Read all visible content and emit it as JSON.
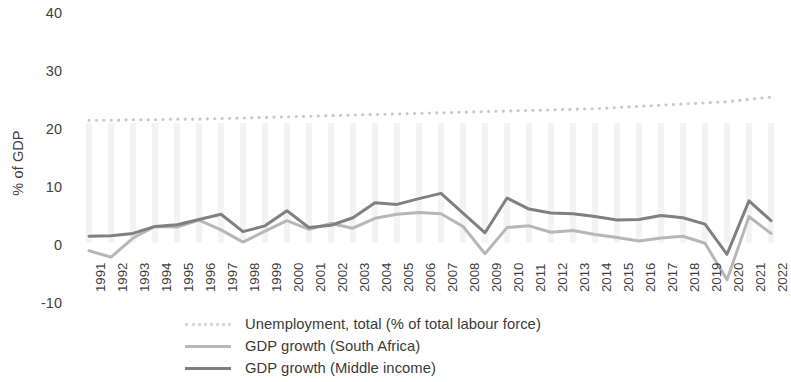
{
  "chart_data": {
    "type": "line",
    "title": "",
    "xlabel": "",
    "ylabel": "% of GDP",
    "ylim": [
      -10,
      40
    ],
    "yticks": [
      40,
      30,
      20,
      10,
      0,
      -10
    ],
    "grid": false,
    "legend_position": "bottom",
    "x": [
      1991,
      1992,
      1993,
      1994,
      1995,
      1996,
      1997,
      1998,
      1999,
      2000,
      2001,
      2002,
      2003,
      2004,
      2005,
      2006,
      2007,
      2008,
      2009,
      2010,
      2011,
      2012,
      2013,
      2014,
      2015,
      2016,
      2017,
      2018,
      2019,
      2020,
      2021,
      2022
    ],
    "categories": [
      "1991",
      "1992",
      "1993",
      "1994",
      "1995",
      "1996",
      "1997",
      "1998",
      "1999",
      "2000",
      "2001",
      "2002",
      "2003",
      "2004",
      "2005",
      "2006",
      "2007",
      "2008",
      "2009",
      "2010",
      "2011",
      "2012",
      "2013",
      "2014",
      "2015",
      "2016",
      "2017",
      "2018",
      "2019",
      "2020",
      "2021",
      "2022"
    ],
    "series": [
      {
        "name": "Unemployment, total (% of total labour force)",
        "style": "dotted",
        "color": "#d9d9d9",
        "values": [
          21.5,
          21.5,
          21.6,
          21.6,
          21.7,
          21.7,
          21.8,
          21.9,
          22.0,
          22.1,
          22.2,
          22.3,
          22.4,
          22.5,
          22.6,
          22.7,
          22.8,
          22.9,
          23.0,
          23.1,
          23.2,
          23.3,
          23.4,
          23.5,
          23.7,
          23.9,
          24.1,
          24.3,
          24.5,
          24.7,
          25.1,
          25.5
        ]
      },
      {
        "name": "GDP growth (South Africa)",
        "style": "solid",
        "color": "#b7b7b7",
        "values": [
          -1.0,
          -2.1,
          1.2,
          3.2,
          3.1,
          4.3,
          2.6,
          0.5,
          2.4,
          4.2,
          2.7,
          3.7,
          2.9,
          4.6,
          5.3,
          5.6,
          5.4,
          3.2,
          -1.5,
          3.0,
          3.3,
          2.2,
          2.5,
          1.8,
          1.3,
          0.7,
          1.2,
          1.5,
          0.3,
          -6.0,
          4.9,
          2.0
        ]
      },
      {
        "name": "GDP growth (Middle income)",
        "style": "solid",
        "color": "#808080",
        "values": [
          1.5,
          1.6,
          2.0,
          3.2,
          3.5,
          4.4,
          5.3,
          2.3,
          3.3,
          5.9,
          3.0,
          3.4,
          4.7,
          7.3,
          7.0,
          8.0,
          8.9,
          5.5,
          2.1,
          8.1,
          6.2,
          5.5,
          5.4,
          4.9,
          4.3,
          4.4,
          5.1,
          4.7,
          3.6,
          -1.6,
          7.6,
          4.2
        ]
      }
    ]
  },
  "axis": {
    "y_title": "% of GDP",
    "y_ticks": [
      "40",
      "30",
      "20",
      "10",
      "0",
      "-10"
    ]
  },
  "legend": {
    "items": [
      {
        "label": "Unemployment, total (% of total labour force)",
        "marker": "dotted-line-swatch",
        "color": "#d9d9d9"
      },
      {
        "label": "GDP growth (South Africa)",
        "marker": "solid-line-swatch",
        "color": "#b7b7b7"
      },
      {
        "label": "GDP growth (Middle income)",
        "marker": "solid-line-swatch",
        "color": "#808080"
      }
    ]
  }
}
